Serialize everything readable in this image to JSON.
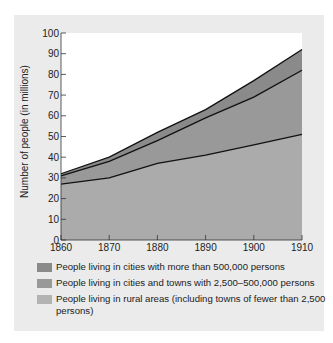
{
  "chart_data": {
    "type": "area",
    "stacked": true,
    "title": "",
    "xlabel": "",
    "ylabel": "Number of people (in millions)",
    "x": [
      1860,
      1870,
      1880,
      1890,
      1900,
      1910
    ],
    "ylim": [
      0,
      100
    ],
    "yticks": [
      0,
      10,
      20,
      30,
      40,
      50,
      60,
      70,
      80,
      90,
      100
    ],
    "xticks": [
      1860,
      1870,
      1880,
      1890,
      1900,
      1910
    ],
    "grid": false,
    "legend_position": "bottom",
    "series": [
      {
        "name": "People living in rural areas (including towns of fewer than 2,500 persons)",
        "values": [
          27,
          30,
          37,
          41,
          46,
          51
        ],
        "cumulative": [
          27,
          30,
          37,
          41,
          46,
          51
        ],
        "color": "#ababab"
      },
      {
        "name": "People living in cities and towns with 2,500–500,000 persons",
        "values": [
          4,
          8,
          11,
          18,
          23,
          31
        ],
        "cumulative": [
          31,
          38,
          48,
          59,
          69,
          82
        ],
        "color": "#999999"
      },
      {
        "name": "People living in cities with more than 500,000 persons",
        "values": [
          1,
          2,
          4,
          4,
          8,
          10
        ],
        "cumulative": [
          32,
          40,
          52,
          63,
          77,
          92
        ],
        "color": "#8a8a8a"
      }
    ]
  },
  "axis": {
    "ylabel": "Number of people (in millions)"
  },
  "legend": [
    {
      "label": "People living in cities with more than 500,000 persons",
      "color": "#8a8a8a"
    },
    {
      "label": "People living in cities and towns with 2,500–500,000 persons",
      "color": "#999999"
    },
    {
      "label": "People living in rural areas (including towns of fewer than 2,500 persons)",
      "color": "#ababab"
    }
  ]
}
